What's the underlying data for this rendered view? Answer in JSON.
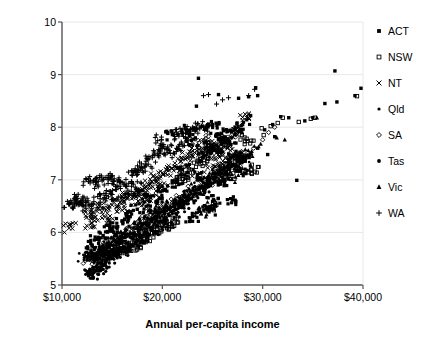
{
  "chart_data": {
    "type": "scatter",
    "title": "",
    "xlabel": "Annual per-capita income",
    "ylabel": "Ecological footprint (ha/capita)",
    "xlim": [
      10000,
      40000
    ],
    "ylim": [
      5,
      10
    ],
    "xticks": [
      "$10,000",
      "$20,000",
      "$30,000",
      "$40,000"
    ],
    "xtick_values": [
      10000,
      20000,
      30000,
      40000
    ],
    "yticks": [
      "5",
      "6",
      "7",
      "8",
      "9",
      "10"
    ],
    "ytick_values": [
      5,
      6,
      7,
      8,
      9,
      10
    ],
    "grid": "horizontal-faint",
    "legend_position": "right",
    "series": [
      {
        "name": "ACT",
        "marker": "filled-square",
        "color": "#000000",
        "points": [
          [
            23500,
            7.1
          ],
          [
            24100,
            7.45
          ],
          [
            24800,
            7.62
          ],
          [
            25400,
            7.55
          ],
          [
            26000,
            7.8
          ],
          [
            26700,
            7.7
          ],
          [
            27300,
            7.95
          ],
          [
            28000,
            8.05
          ],
          [
            28800,
            8.22
          ],
          [
            29500,
            7.6
          ],
          [
            30200,
            7.95
          ],
          [
            31000,
            8.05
          ],
          [
            31800,
            8.2
          ],
          [
            32600,
            8.18
          ],
          [
            33400,
            6.99
          ],
          [
            34200,
            8.12
          ],
          [
            35000,
            8.18
          ],
          [
            36200,
            8.45
          ],
          [
            37200,
            9.07
          ],
          [
            37400,
            8.48
          ],
          [
            39200,
            8.6
          ],
          [
            39800,
            8.74
          ],
          [
            23600,
            8.93
          ],
          [
            23400,
            8.4
          ],
          [
            27600,
            8.55
          ],
          [
            28600,
            8.58
          ],
          [
            25600,
            8.62
          ],
          [
            29300,
            8.75
          ],
          [
            29500,
            8.6
          ],
          [
            21000,
            7.86
          ],
          [
            22400,
            7.95
          ],
          [
            24400,
            7.98
          ],
          [
            25000,
            8.05
          ],
          [
            25900,
            7.88
          ],
          [
            26400,
            7.72
          ],
          [
            22900,
            7.75
          ],
          [
            27100,
            7.44
          ],
          [
            27800,
            7.18
          ],
          [
            26200,
            6.96
          ],
          [
            25100,
            6.62
          ],
          [
            24700,
            6.42
          ],
          [
            23000,
            6.3
          ],
          [
            27000,
            6.62
          ],
          [
            28200,
            7.36
          ],
          [
            30500,
            7.48
          ],
          [
            31200,
            7.82
          ],
          [
            22000,
            7.2
          ],
          [
            21500,
            6.95
          ],
          [
            20200,
            6.8
          ],
          [
            19500,
            6.6
          ],
          [
            18800,
            6.5
          ],
          [
            18200,
            6.72
          ],
          [
            17500,
            6.44
          ],
          [
            16800,
            6.3
          ],
          [
            16000,
            6.22
          ],
          [
            15400,
            6.1
          ],
          [
            14800,
            6.05
          ],
          [
            14100,
            5.94
          ],
          [
            13500,
            5.88
          ],
          [
            13000,
            5.76
          ]
        ]
      },
      {
        "name": "NSW",
        "marker": "open-square",
        "color": "#000000",
        "points": [
          [
            13200,
            5.5
          ],
          [
            13700,
            5.52
          ],
          [
            14000,
            5.58
          ],
          [
            14400,
            5.56
          ],
          [
            14900,
            5.62
          ],
          [
            15300,
            5.6
          ],
          [
            15800,
            5.66
          ],
          [
            16200,
            5.7
          ],
          [
            16800,
            5.74
          ],
          [
            17400,
            5.8
          ],
          [
            17900,
            5.86
          ],
          [
            18500,
            5.92
          ],
          [
            19200,
            6.0
          ],
          [
            19800,
            6.08
          ],
          [
            20400,
            6.14
          ],
          [
            21000,
            6.2
          ],
          [
            24300,
            7.5
          ],
          [
            25200,
            7.62
          ],
          [
            26000,
            7.72
          ],
          [
            28400,
            7.78
          ],
          [
            29900,
            7.98
          ],
          [
            30800,
            8.02
          ],
          [
            31500,
            8.08
          ],
          [
            33600,
            8.1
          ],
          [
            35200,
            8.18
          ],
          [
            39400,
            8.59
          ],
          [
            27200,
            7.42
          ],
          [
            23800,
            7.3
          ],
          [
            22500,
            7.1
          ],
          [
            21800,
            6.96
          ],
          [
            28900,
            7.2
          ],
          [
            30100,
            7.85
          ],
          [
            32000,
            8.18
          ],
          [
            34800,
            8.16
          ],
          [
            24900,
            6.48
          ],
          [
            26600,
            7.08
          ]
        ]
      },
      {
        "name": "NT",
        "marker": "cross-x",
        "color": "#000000",
        "points": [
          [
            10700,
            6.08
          ],
          [
            12900,
            6.35
          ],
          [
            13500,
            6.4
          ],
          [
            14200,
            6.46
          ],
          [
            15000,
            6.52
          ],
          [
            15800,
            6.58
          ],
          [
            16500,
            6.66
          ],
          [
            17200,
            6.74
          ],
          [
            18000,
            6.82
          ],
          [
            18800,
            6.92
          ],
          [
            19500,
            7.02
          ],
          [
            20300,
            7.12
          ],
          [
            21000,
            7.22
          ],
          [
            21800,
            7.34
          ],
          [
            22500,
            7.44
          ],
          [
            23200,
            7.52
          ],
          [
            24000,
            7.6
          ],
          [
            24800,
            7.66
          ],
          [
            25600,
            7.48
          ],
          [
            26500,
            7.66
          ],
          [
            27300,
            7.9
          ],
          [
            28400,
            8.18
          ],
          [
            22000,
            7.18
          ],
          [
            20000,
            6.9
          ],
          [
            17600,
            6.6
          ],
          [
            16000,
            6.42
          ],
          [
            14600,
            6.28
          ],
          [
            13000,
            6.18
          ],
          [
            26000,
            7.3
          ],
          [
            25000,
            7.2
          ],
          [
            23600,
            7.08
          ],
          [
            19000,
            6.7
          ]
        ]
      },
      {
        "name": "Qld",
        "marker": "small-dot",
        "color": "#000000",
        "points": [
          [
            13000,
            5.6
          ],
          [
            13600,
            5.64
          ],
          [
            14200,
            5.7
          ],
          [
            14800,
            5.76
          ],
          [
            15400,
            5.82
          ],
          [
            16000,
            5.88
          ],
          [
            16600,
            5.94
          ],
          [
            17200,
            6.0
          ],
          [
            17800,
            6.08
          ],
          [
            18400,
            6.16
          ],
          [
            19000,
            6.22
          ],
          [
            19600,
            6.3
          ],
          [
            20200,
            6.38
          ],
          [
            20800,
            6.46
          ],
          [
            21400,
            6.54
          ],
          [
            22000,
            6.62
          ],
          [
            22600,
            6.7
          ],
          [
            23200,
            6.78
          ],
          [
            23800,
            6.86
          ],
          [
            24400,
            6.94
          ],
          [
            25000,
            7.02
          ],
          [
            25600,
            7.1
          ],
          [
            26200,
            7.18
          ],
          [
            26800,
            7.26
          ],
          [
            27400,
            7.34
          ],
          [
            28000,
            7.42
          ],
          [
            12600,
            5.56
          ],
          [
            12200,
            5.52
          ]
        ]
      },
      {
        "name": "SA",
        "marker": "open-diamond",
        "color": "#000000",
        "points": [
          [
            12800,
            5.5
          ],
          [
            13400,
            5.58
          ],
          [
            14000,
            5.66
          ],
          [
            14700,
            5.74
          ],
          [
            15400,
            5.82
          ],
          [
            16100,
            5.92
          ],
          [
            16900,
            6.02
          ],
          [
            17700,
            6.12
          ],
          [
            18500,
            6.22
          ],
          [
            19300,
            6.34
          ],
          [
            20100,
            6.44
          ],
          [
            21000,
            6.56
          ],
          [
            21900,
            6.66
          ],
          [
            22800,
            6.78
          ],
          [
            23700,
            6.88
          ],
          [
            24600,
            6.98
          ],
          [
            25500,
            7.08
          ],
          [
            26400,
            7.2
          ],
          [
            27300,
            7.34
          ],
          [
            28200,
            7.46
          ],
          [
            29100,
            7.6
          ],
          [
            30000,
            7.76
          ],
          [
            31200,
            8.0
          ],
          [
            19800,
            6.4
          ],
          [
            23000,
            7.68
          ],
          [
            24200,
            7.75
          ],
          [
            26900,
            7.85
          ],
          [
            30600,
            7.9
          ]
        ]
      },
      {
        "name": "Tas",
        "marker": "filled-dot",
        "color": "#000000",
        "points": [
          [
            12600,
            5.22
          ],
          [
            13000,
            5.28
          ],
          [
            13400,
            5.34
          ],
          [
            13900,
            5.4
          ],
          [
            14400,
            5.46
          ],
          [
            14900,
            5.52
          ],
          [
            15400,
            5.58
          ],
          [
            15900,
            5.64
          ],
          [
            16400,
            5.7
          ],
          [
            16900,
            5.76
          ],
          [
            17400,
            5.82
          ],
          [
            17900,
            5.9
          ],
          [
            18400,
            5.96
          ],
          [
            18900,
            6.04
          ],
          [
            19400,
            6.12
          ],
          [
            19900,
            6.2
          ],
          [
            20400,
            6.28
          ],
          [
            21000,
            6.36
          ],
          [
            21600,
            6.46
          ],
          [
            22200,
            6.56
          ],
          [
            22800,
            6.64
          ],
          [
            23400,
            6.74
          ],
          [
            24000,
            6.84
          ],
          [
            24600,
            6.94
          ],
          [
            25200,
            7.04
          ],
          [
            13200,
            5.24
          ],
          [
            12900,
            5.2
          ],
          [
            14100,
            5.3
          ]
        ]
      },
      {
        "name": "Vic",
        "marker": "triangle",
        "color": "#000000",
        "points": [
          [
            13200,
            5.58
          ],
          [
            13900,
            5.66
          ],
          [
            14600,
            5.74
          ],
          [
            15300,
            5.84
          ],
          [
            16000,
            5.92
          ],
          [
            16800,
            6.0
          ],
          [
            17600,
            6.1
          ],
          [
            18400,
            6.2
          ],
          [
            19200,
            6.3
          ],
          [
            20000,
            6.4
          ],
          [
            20800,
            6.5
          ],
          [
            21700,
            6.6
          ],
          [
            22600,
            6.7
          ],
          [
            23500,
            6.82
          ],
          [
            24400,
            6.94
          ],
          [
            25300,
            7.06
          ],
          [
            26200,
            7.18
          ],
          [
            27100,
            7.3
          ],
          [
            28000,
            7.42
          ],
          [
            28900,
            7.54
          ],
          [
            29800,
            7.68
          ],
          [
            31400,
            7.8
          ],
          [
            32200,
            7.76
          ],
          [
            35400,
            8.18
          ],
          [
            27700,
            7.16
          ],
          [
            26600,
            7.02
          ],
          [
            24900,
            6.52
          ],
          [
            23800,
            6.4
          ]
        ]
      },
      {
        "name": "WA",
        "marker": "plus",
        "color": "#000000",
        "points": [
          [
            10700,
            6.54
          ],
          [
            11300,
            6.62
          ],
          [
            11900,
            6.6
          ],
          [
            12300,
            6.5
          ],
          [
            12800,
            6.94
          ],
          [
            13400,
            6.96
          ],
          [
            14000,
            6.98
          ],
          [
            14600,
            7.0
          ],
          [
            15200,
            7.02
          ],
          [
            15800,
            6.96
          ],
          [
            16400,
            6.9
          ],
          [
            17000,
            7.08
          ],
          [
            17600,
            7.18
          ],
          [
            18300,
            7.3
          ],
          [
            19000,
            7.42
          ],
          [
            19700,
            7.56
          ],
          [
            20400,
            7.58
          ],
          [
            21200,
            7.86
          ],
          [
            22000,
            7.88
          ],
          [
            22800,
            7.96
          ],
          [
            23400,
            7.98
          ],
          [
            23900,
            8.02
          ],
          [
            24600,
            8.62
          ],
          [
            25400,
            8.44
          ],
          [
            26000,
            8.52
          ],
          [
            26600,
            8.56
          ],
          [
            28600,
            8.6
          ],
          [
            24100,
            8.6
          ],
          [
            19900,
            7.76
          ],
          [
            18000,
            7.22
          ],
          [
            16900,
            6.78
          ],
          [
            12600,
            6.6
          ],
          [
            13800,
            6.64
          ],
          [
            15000,
            6.72
          ],
          [
            11600,
            6.58
          ],
          [
            29200,
            8.72
          ],
          [
            21600,
            7.64
          ],
          [
            20800,
            7.5
          ],
          [
            17300,
            6.86
          ],
          [
            14400,
            6.7
          ]
        ]
      }
    ]
  },
  "legend": {
    "items": [
      {
        "label": "ACT",
        "marker": "filled-square"
      },
      {
        "label": "NSW",
        "marker": "open-square"
      },
      {
        "label": "NT",
        "marker": "cross-x"
      },
      {
        "label": "Qld",
        "marker": "small-dot"
      },
      {
        "label": "SA",
        "marker": "open-diamond"
      },
      {
        "label": "Tas",
        "marker": "filled-dot"
      },
      {
        "label": "Vic",
        "marker": "triangle"
      },
      {
        "label": "WA",
        "marker": "plus"
      }
    ]
  },
  "style": {
    "axis_color": "#555555",
    "grid_color": "#e8e8e8",
    "marker_color": "#000000",
    "text_color": "#000000"
  }
}
